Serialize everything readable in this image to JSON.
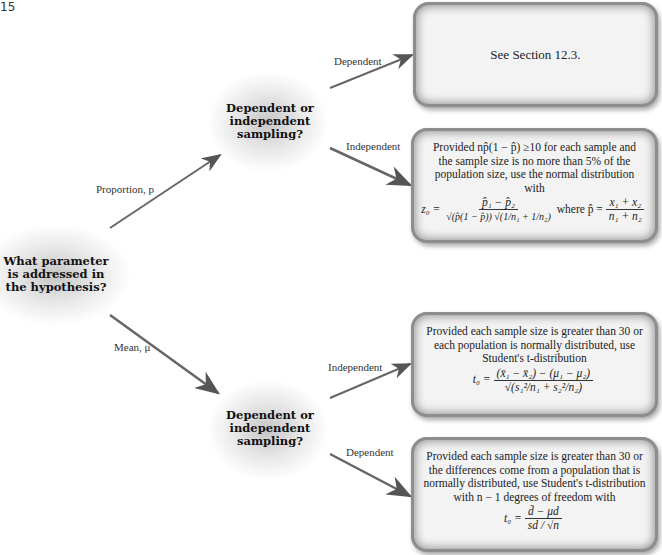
{
  "page_number": "15",
  "root": {
    "question": "What parameter is addressed in the hypothesis?"
  },
  "branches": {
    "proportion": {
      "label": "Proportion, p",
      "node": "Dependent or independent sampling?",
      "dependent": {
        "label": "Dependent",
        "box": "See Section 12.3."
      },
      "independent": {
        "label": "Independent",
        "box_text": "Provided np̂(1 − p̂) ≥10 for each sample and the sample size is no more than 5% of the population size, use the normal distribution with",
        "formula": {
          "lhs": "z₀ =",
          "numerator": "p̂₁ − p̂₂",
          "denominator": "√(p̂(1 − p̂)) √(1/n₁ + 1/n₂)",
          "where": "where p̂ =",
          "where_num": "x₁ + x₂",
          "where_den": "n₁ + n₂"
        }
      }
    },
    "mean": {
      "label": "Mean, μ",
      "node": "Dependent or independent sampling?",
      "independent": {
        "label": "Independent",
        "box_text": "Provided each sample size is greater than 30 or each population is normally distributed, use Student's t-distribution",
        "formula": {
          "lhs": "t₀ =",
          "numerator": "(x̄₁ − x̄₂) − (μ₁ − μ₂)",
          "denominator": "√(s₁²/n₁ + s₂²/n₂)"
        }
      },
      "dependent": {
        "label": "Dependent",
        "box_text": "Provided each sample size is greater than 30 or the differences come from a population that is normally distributed, use Student's t-distribution with n − 1 degrees of freedom with",
        "formula": {
          "lhs": "t₀ =",
          "numerator": "d̄ − μd",
          "denominator": "sd / √n"
        }
      }
    }
  }
}
